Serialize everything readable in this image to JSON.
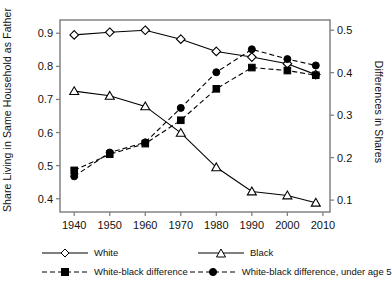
{
  "chart_data": {
    "type": "line",
    "title": "",
    "xlabel": "",
    "ylabel": "Share Living in Same Household as Father",
    "y2label": "Differences in Shares",
    "x": [
      1940,
      1950,
      1960,
      1970,
      1980,
      1990,
      2000,
      2008
    ],
    "xtick_labels": [
      "1940",
      "1950",
      "1960",
      "1970",
      "1980",
      "1990",
      "2000",
      "2010"
    ],
    "xtick_values": [
      1940,
      1950,
      1960,
      1970,
      1980,
      1990,
      2000,
      2010
    ],
    "xlim": [
      1936,
      2012
    ],
    "ylim": [
      0.36,
      0.94
    ],
    "ytick_labels": [
      "0.4",
      "0.5",
      "0.6",
      "0.7",
      "0.8",
      "0.9"
    ],
    "ytick_values": [
      0.4,
      0.5,
      0.6,
      0.7,
      0.8,
      0.9
    ],
    "y2lim": [
      0.072,
      0.524
    ],
    "y2tick_labels": [
      "0.1",
      "0.2",
      "0.3",
      "0.4",
      "0.5"
    ],
    "y2tick_values": [
      0.1,
      0.2,
      0.3,
      0.4,
      0.5
    ],
    "grid": false,
    "legend_position": "below",
    "series": [
      {
        "name": "White",
        "axis": "left",
        "marker": "open-diamond",
        "linestyle": "solid",
        "color": "#000000",
        "values": [
          0.895,
          0.903,
          0.909,
          0.882,
          0.845,
          0.828,
          0.808,
          0.775
        ]
      },
      {
        "name": "Black",
        "axis": "left",
        "marker": "open-triangle",
        "linestyle": "solid",
        "color": "#000000",
        "values": [
          0.725,
          0.711,
          0.679,
          0.599,
          0.495,
          0.422,
          0.41,
          0.388
        ]
      },
      {
        "name": "White-black difference",
        "axis": "right",
        "marker": "filled-square",
        "linestyle": "dashed",
        "color": "#000000",
        "values": [
          0.17,
          0.208,
          0.233,
          0.288,
          0.362,
          0.412,
          0.405,
          0.394
        ]
      },
      {
        "name": "White-black difference, under age 5",
        "axis": "right",
        "marker": "filled-circle",
        "linestyle": "dashed",
        "color": "#000000",
        "values": [
          0.156,
          0.212,
          0.236,
          0.317,
          0.401,
          0.455,
          0.432,
          0.417
        ]
      }
    ]
  },
  "legend": {
    "items": [
      {
        "label": "White",
        "marker": "open-diamond",
        "linestyle": "solid"
      },
      {
        "label": "Black",
        "marker": "open-triangle",
        "linestyle": "solid"
      },
      {
        "label": "White-black difference",
        "marker": "filled-square",
        "linestyle": "dashed"
      },
      {
        "label": "White-black difference, under age 5",
        "marker": "filled-circle",
        "linestyle": "dashed"
      }
    ]
  },
  "style": {
    "line_color": "#000000",
    "frame_color": "#7a7a7a",
    "background": "#ffffff"
  }
}
